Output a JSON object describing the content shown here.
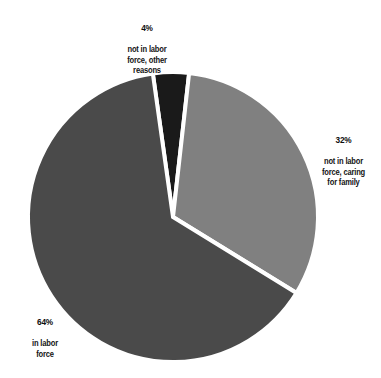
{
  "chart_data": {
    "type": "pie",
    "title": "",
    "subtitle": "",
    "xlabel": "",
    "ylabel": "",
    "legend_position": "none",
    "grid": false,
    "slice_gap": "white",
    "background_color": "#ffffff",
    "categories": [
      "not in labor force, other reasons",
      "not in labor force, caring for family",
      "in labor force"
    ],
    "values": [
      4,
      32,
      64
    ],
    "value_labels": [
      "4%",
      "32%",
      "64%"
    ],
    "colors": [
      "#1a1a1a",
      "#808080",
      "#4a4a4a"
    ],
    "slices": [
      {
        "id": "other-reasons",
        "percent": 4,
        "percent_label": "4%",
        "description": "not in labor\nforce, other\nreasons",
        "color": "#1a1a1a",
        "start_angle_deg": 0,
        "end_angle_deg": 14.4
      },
      {
        "id": "caring-for-family",
        "percent": 32,
        "percent_label": "32%",
        "description": "not in labor\nforce, caring\nfor family",
        "color": "#808080",
        "start_angle_deg": 14.4,
        "end_angle_deg": 129.6
      },
      {
        "id": "in-labor-force",
        "percent": 64,
        "percent_label": "64%",
        "description": "in labor\nforce",
        "color": "#4a4a4a",
        "start_angle_deg": 129.6,
        "end_angle_deg": 360
      }
    ],
    "geometry": {
      "center_x": 173,
      "center_y": 217,
      "radius": 145,
      "rotation_deg": -8
    }
  },
  "labels": {
    "other_reasons": {
      "percent": "4%",
      "description": "not in labor\nforce, other\nreasons"
    },
    "caring_for_family": {
      "percent": "32%",
      "description": "not in labor\nforce, caring\nfor family"
    },
    "in_labor_force": {
      "percent": "64%",
      "description": "in labor\nforce"
    }
  }
}
